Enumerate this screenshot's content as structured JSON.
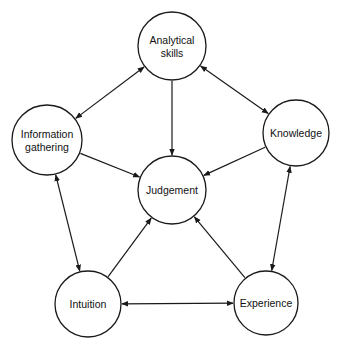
{
  "diagram": {
    "type": "network",
    "nodes": [
      {
        "id": "analytical",
        "lines": [
          "Analytical",
          "skills"
        ],
        "cx": 172,
        "cy": 46,
        "r": 34
      },
      {
        "id": "information",
        "lines": [
          "Information",
          "gathering"
        ],
        "cx": 47,
        "cy": 140,
        "r": 35
      },
      {
        "id": "knowledge",
        "lines": [
          "Knowledge"
        ],
        "cx": 296,
        "cy": 133,
        "r": 33
      },
      {
        "id": "judgement",
        "lines": [
          "Judgement"
        ],
        "cx": 172,
        "cy": 190,
        "r": 34
      },
      {
        "id": "intuition",
        "lines": [
          "Intuition"
        ],
        "cx": 88,
        "cy": 304,
        "r": 33
      },
      {
        "id": "experience",
        "lines": [
          "Experience"
        ],
        "cx": 266,
        "cy": 303,
        "r": 32
      }
    ],
    "edges": [
      {
        "from": "analytical",
        "to": "information",
        "direction": "both"
      },
      {
        "from": "analytical",
        "to": "knowledge",
        "direction": "both"
      },
      {
        "from": "information",
        "to": "intuition",
        "direction": "both"
      },
      {
        "from": "knowledge",
        "to": "experience",
        "direction": "both"
      },
      {
        "from": "intuition",
        "to": "experience",
        "direction": "both"
      },
      {
        "from": "analytical",
        "to": "judgement",
        "direction": "forward"
      },
      {
        "from": "information",
        "to": "judgement",
        "direction": "forward"
      },
      {
        "from": "knowledge",
        "to": "judgement",
        "direction": "forward"
      },
      {
        "from": "intuition",
        "to": "judgement",
        "direction": "forward"
      },
      {
        "from": "experience",
        "to": "judgement",
        "direction": "forward"
      }
    ],
    "colors": {
      "stroke": "#1a1a1a",
      "fill": "#ffffff",
      "text": "#111111"
    }
  }
}
